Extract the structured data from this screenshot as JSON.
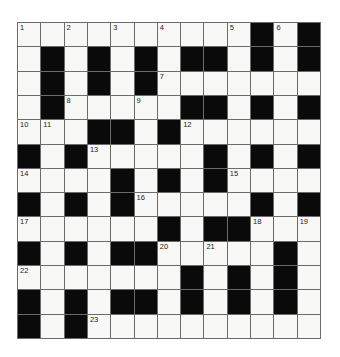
{
  "puzzle": {
    "type": "crossword",
    "rows": 13,
    "cols": 13,
    "legend": {
      "W": "white cell",
      "B": "black cell"
    },
    "grid": [
      [
        "W",
        "W",
        "W",
        "W",
        "W",
        "W",
        "W",
        "W",
        "W",
        "W",
        "B",
        "W",
        "B"
      ],
      [
        "W",
        "B",
        "W",
        "B",
        "W",
        "B",
        "W",
        "B",
        "B",
        "W",
        "B",
        "W",
        "B"
      ],
      [
        "W",
        "B",
        "W",
        "B",
        "W",
        "B",
        "W",
        "W",
        "W",
        "W",
        "W",
        "W",
        "W"
      ],
      [
        "W",
        "B",
        "W",
        "W",
        "W",
        "W",
        "W",
        "B",
        "B",
        "W",
        "B",
        "W",
        "B"
      ],
      [
        "W",
        "W",
        "W",
        "B",
        "B",
        "W",
        "B",
        "W",
        "W",
        "W",
        "W",
        "W",
        "W"
      ],
      [
        "B",
        "W",
        "B",
        "W",
        "W",
        "W",
        "W",
        "W",
        "B",
        "W",
        "B",
        "W",
        "B"
      ],
      [
        "W",
        "W",
        "W",
        "W",
        "B",
        "W",
        "B",
        "W",
        "B",
        "W",
        "W",
        "W",
        "W"
      ],
      [
        "B",
        "W",
        "B",
        "W",
        "B",
        "W",
        "W",
        "W",
        "W",
        "W",
        "B",
        "W",
        "B"
      ],
      [
        "W",
        "W",
        "W",
        "W",
        "W",
        "W",
        "B",
        "W",
        "B",
        "B",
        "W",
        "W",
        "W"
      ],
      [
        "B",
        "W",
        "B",
        "W",
        "B",
        "B",
        "W",
        "W",
        "W",
        "W",
        "W",
        "B",
        "W"
      ],
      [
        "W",
        "W",
        "W",
        "W",
        "W",
        "W",
        "W",
        "B",
        "W",
        "B",
        "W",
        "B",
        "W"
      ],
      [
        "B",
        "W",
        "B",
        "W",
        "B",
        "B",
        "W",
        "B",
        "W",
        "B",
        "W",
        "B",
        "W"
      ],
      [
        "B",
        "W",
        "B",
        "W",
        "W",
        "W",
        "W",
        "W",
        "W",
        "W",
        "W",
        "W",
        "W"
      ]
    ],
    "numbers": [
      {
        "row": 0,
        "col": 0,
        "n": "1"
      },
      {
        "row": 0,
        "col": 2,
        "n": "2"
      },
      {
        "row": 0,
        "col": 4,
        "n": "3"
      },
      {
        "row": 0,
        "col": 6,
        "n": "4"
      },
      {
        "row": 0,
        "col": 9,
        "n": "5"
      },
      {
        "row": 0,
        "col": 11,
        "n": "6"
      },
      {
        "row": 2,
        "col": 6,
        "n": "7"
      },
      {
        "row": 3,
        "col": 2,
        "n": "8"
      },
      {
        "row": 3,
        "col": 5,
        "n": "9"
      },
      {
        "row": 4,
        "col": 0,
        "n": "10"
      },
      {
        "row": 4,
        "col": 1,
        "n": "11"
      },
      {
        "row": 4,
        "col": 7,
        "n": "12"
      },
      {
        "row": 5,
        "col": 3,
        "n": "13"
      },
      {
        "row": 6,
        "col": 0,
        "n": "14"
      },
      {
        "row": 6,
        "col": 9,
        "n": "15"
      },
      {
        "row": 7,
        "col": 5,
        "n": "16"
      },
      {
        "row": 8,
        "col": 0,
        "n": "17"
      },
      {
        "row": 8,
        "col": 10,
        "n": "18"
      },
      {
        "row": 8,
        "col": 12,
        "n": "19"
      },
      {
        "row": 9,
        "col": 6,
        "n": "20"
      },
      {
        "row": 9,
        "col": 8,
        "n": "21"
      },
      {
        "row": 10,
        "col": 0,
        "n": "22"
      },
      {
        "row": 12,
        "col": 3,
        "n": "23"
      }
    ],
    "colors": {
      "black": "#0a0a0a",
      "white": "#f8f8f6",
      "gridline": "#6b6b6b"
    }
  }
}
